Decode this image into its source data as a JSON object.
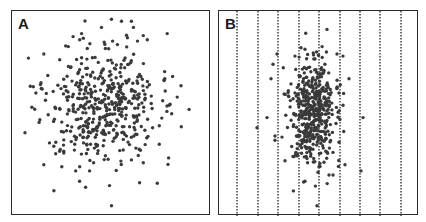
{
  "chart_data": [
    {
      "type": "scatter",
      "panel_label": "A",
      "title": "",
      "xlabel": "",
      "ylabel": "",
      "grid": false,
      "description": "Isotropic 2D cloud of ~500 points centered slightly left of panel center, broad spread",
      "frame": {
        "left": 11,
        "top": 10,
        "width": 199,
        "height": 205
      },
      "cluster": {
        "cx": 0.46,
        "cy": 0.47,
        "sx": 0.14,
        "sy": 0.14,
        "n": 470,
        "seed": 11
      },
      "outliers": [
        [
          0.5,
          0.04
        ],
        [
          0.55,
          0.05
        ],
        [
          0.6,
          0.05
        ],
        [
          0.61,
          0.08
        ],
        [
          0.78,
          0.11
        ],
        [
          0.35,
          0.11
        ],
        [
          0.34,
          0.14
        ],
        [
          0.45,
          0.08
        ],
        [
          0.58,
          0.13
        ],
        [
          0.66,
          0.12
        ],
        [
          0.68,
          0.14
        ],
        [
          0.27,
          0.17
        ],
        [
          0.16,
          0.21
        ],
        [
          0.12,
          0.4
        ],
        [
          0.14,
          0.53
        ],
        [
          0.1,
          0.47
        ],
        [
          0.16,
          0.75
        ],
        [
          0.25,
          0.76
        ],
        [
          0.32,
          0.78
        ],
        [
          0.39,
          0.78
        ],
        [
          0.37,
          0.86
        ],
        [
          0.5,
          0.95
        ],
        [
          0.73,
          0.84
        ],
        [
          0.66,
          0.74
        ],
        [
          0.74,
          0.65
        ],
        [
          0.74,
          0.56
        ],
        [
          0.89,
          0.48
        ],
        [
          0.79,
          0.46
        ],
        [
          0.83,
          0.42
        ],
        [
          0.77,
          0.39
        ],
        [
          0.41,
          0.74
        ],
        [
          0.34,
          0.76
        ],
        [
          0.21,
          0.66
        ],
        [
          0.22,
          0.64
        ]
      ],
      "dot_color": "#3a3a3a"
    },
    {
      "type": "scatter",
      "panel_label": "B",
      "title": "",
      "xlabel": "",
      "ylabel": "",
      "grid": "vertical dashed lines",
      "description": "Same points compressed horizontally into a narrow vertical cluster; 9 evenly spaced vertical dotted divider lines",
      "frame": {
        "left": 218,
        "top": 10,
        "width": 200,
        "height": 205
      },
      "vertical_lines_x": [
        18,
        39,
        59,
        80,
        100,
        121,
        141,
        161,
        182
      ],
      "cluster": {
        "cx": 0.47,
        "cy": 0.5,
        "sx": 0.055,
        "sy": 0.13,
        "n": 470,
        "seed": 11
      },
      "outliers": [
        [
          0.54,
          0.09
        ],
        [
          0.29,
          0.21
        ],
        [
          0.27,
          0.26
        ],
        [
          0.26,
          0.33
        ],
        [
          0.24,
          0.52
        ],
        [
          0.38,
          0.22
        ],
        [
          0.59,
          0.21
        ],
        [
          0.62,
          0.22
        ],
        [
          0.65,
          0.33
        ],
        [
          0.72,
          0.52
        ],
        [
          0.6,
          0.4
        ],
        [
          0.62,
          0.46
        ],
        [
          0.19,
          0.57
        ],
        [
          0.28,
          0.61
        ],
        [
          0.28,
          0.63
        ],
        [
          0.44,
          0.72
        ],
        [
          0.5,
          0.76
        ],
        [
          0.43,
          0.83
        ],
        [
          0.49,
          0.95
        ],
        [
          0.55,
          0.8
        ],
        [
          0.57,
          0.8
        ],
        [
          0.63,
          0.75
        ],
        [
          0.71,
          0.78
        ],
        [
          0.57,
          0.69
        ],
        [
          0.6,
          0.64
        ],
        [
          0.33,
          0.73
        ],
        [
          0.37,
          0.71
        ]
      ],
      "dot_color": "#3a3a3a"
    }
  ],
  "panels": {
    "a": {
      "label": "A"
    },
    "b": {
      "label": "B"
    }
  },
  "colors": {
    "frame": "#2b2b2b",
    "dots": "#3a3a3a",
    "grid": "#333333",
    "background": "#ffffff"
  }
}
